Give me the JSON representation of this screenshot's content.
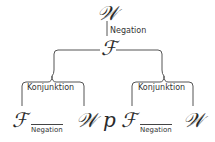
{
  "diagram": {
    "root": {
      "symbol": "𝒲"
    },
    "root_edge": {
      "label": "Negation"
    },
    "mid": {
      "symbol": "ℱ"
    },
    "left_branch": {
      "bracket_label": "Konjunktion",
      "left_symbol": "ℱ",
      "relation_label": "Negation",
      "right_symbol": "𝒲"
    },
    "center_symbol": "p",
    "right_branch": {
      "bracket_label": "Konjunktion",
      "left_symbol": "ℱ",
      "relation_label": "Negation",
      "right_symbol": "𝒲"
    },
    "colors": {
      "stroke": "#555555",
      "text": "#2a2a2a",
      "background": "#ffffff"
    }
  }
}
